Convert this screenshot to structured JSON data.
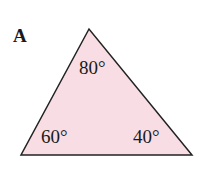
{
  "figure": {
    "label": "A",
    "fill_color": "#f8dde4",
    "stroke_color": "#222222",
    "angles": {
      "top": "80°",
      "bottom_left": "60°",
      "bottom_right": "40°"
    }
  }
}
